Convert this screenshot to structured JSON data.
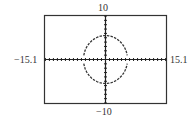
{
  "chart_data": {
    "type": "line",
    "title": "",
    "xlabel": "",
    "ylabel": "",
    "window": {
      "xmin": -15.1,
      "xmax": 15.1,
      "ymin": -10,
      "ymax": 10
    },
    "xlim": [
      -15.1,
      15.1
    ],
    "ylim": [
      -10,
      10
    ],
    "tick_labels": {
      "xmin": "−15.1",
      "xmax": "15.1",
      "ymin": "−10",
      "ymax": "10"
    },
    "grid": false,
    "axes_ticks": "unit tick marks along both axes",
    "series": [
      {
        "name": "upper semicircle",
        "equation": "y = sqrt(30 - x^2)",
        "radius": 5.5,
        "center": [
          0,
          0
        ]
      },
      {
        "name": "lower semicircle",
        "equation": "y = -sqrt(30 - x^2)",
        "radius": 5.5,
        "center": [
          0,
          0
        ]
      }
    ],
    "style": {
      "line": "dashed/dotted pixels",
      "color": "#333333"
    }
  }
}
